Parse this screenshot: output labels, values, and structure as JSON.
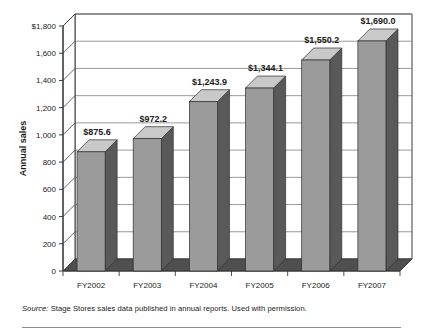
{
  "chart_data": {
    "type": "bar",
    "title": "",
    "subtitle": "",
    "xlabel": "",
    "ylabel": "Annual sales",
    "categories": [
      "FY2002",
      "FY2003",
      "FY2004",
      "FY2005",
      "FY2006",
      "FY2007"
    ],
    "values": [
      875.6,
      972.2,
      1243.9,
      1344.1,
      1550.2,
      1690.0
    ],
    "data_labels": [
      "$875.6",
      "$972.2",
      "$1,243.9",
      "$1,344.1",
      "$1,550.2",
      "$1,690.0"
    ],
    "ylim": [
      0,
      1800
    ],
    "ytick_values": [
      0,
      200,
      400,
      600,
      800,
      1000,
      1200,
      1400,
      1600,
      1800
    ],
    "ytick_labels": [
      "0",
      "200",
      "400",
      "600",
      "800",
      "1,000",
      "1,200",
      "1,400",
      "1,600",
      "$1,800"
    ],
    "grid": "horizontal",
    "legend": "none",
    "style": "3d-column",
    "colors": {
      "bar_front": "#9b9b9b",
      "bar_top": "#c9c9c9",
      "bar_side": "#595959",
      "floor": "#4f4f4f",
      "gridline": "#808080",
      "axis": "#3d3d3d",
      "background": "#ffffff",
      "text": "#1a1a1a"
    }
  },
  "axis": {
    "y_title": "Annual sales"
  },
  "source": {
    "label": "Source:",
    "text": "Stage Stores sales data published in annual reports. Used with permission."
  }
}
